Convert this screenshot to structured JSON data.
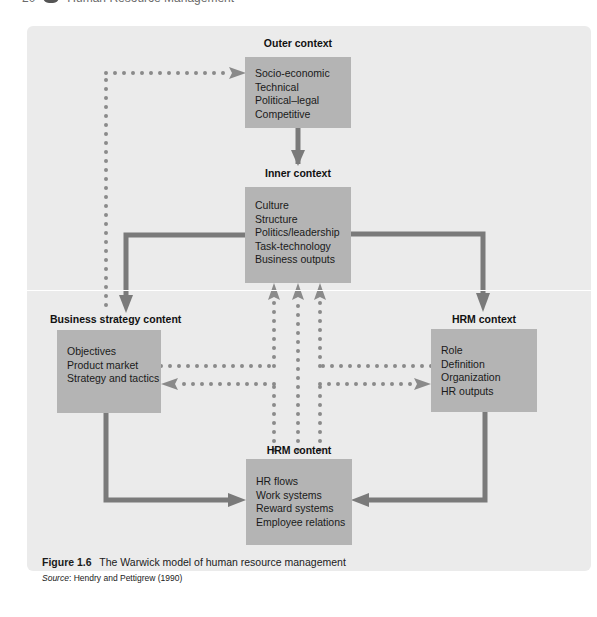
{
  "page_header": {
    "page_number": "20",
    "running_title": "Human Resource Management",
    "icon": "book-icon"
  },
  "diagram": {
    "title": "The Warwick model of human resource management",
    "colors": {
      "panel_background": "#ebebeb",
      "box_fill": "#b4b4b4",
      "arrow": "#7a7a7a",
      "dotted_arrow": "#8a8a8a"
    },
    "nodes": {
      "outer_context": {
        "title": "Outer context",
        "items": [
          "Socio-economic",
          "Technical",
          "Political–legal",
          "Competitive"
        ]
      },
      "inner_context": {
        "title": "Inner context",
        "items": [
          "Culture",
          "Structure",
          "Politics/leadership",
          "Task-technology",
          "Business outputs"
        ]
      },
      "business_strategy_content": {
        "title": "Business strategy content",
        "items": [
          "Objectives",
          "Product market",
          "Strategy and tactics"
        ]
      },
      "hrm_context": {
        "title": "HRM context",
        "items": [
          "Role",
          "Definition",
          "Organization",
          "HR outputs"
        ]
      },
      "hrm_content": {
        "title": "HRM content",
        "items": [
          "HR flows",
          "Work systems",
          "Reward systems",
          "Employee relations"
        ]
      }
    },
    "edges": [
      {
        "from": "Outer context",
        "to": "Inner context",
        "style": "solid"
      },
      {
        "from": "Inner context",
        "to": "Business strategy content",
        "style": "solid"
      },
      {
        "from": "Inner context",
        "to": "HRM context",
        "style": "solid"
      },
      {
        "from": "Business strategy content",
        "to": "HRM content",
        "style": "solid"
      },
      {
        "from": "HRM context",
        "to": "HRM content",
        "style": "solid"
      },
      {
        "from": "Business strategy content",
        "to": "Outer context",
        "style": "dotted"
      },
      {
        "from": "Business strategy content",
        "to": "Inner context",
        "style": "dotted"
      },
      {
        "from": "HRM content",
        "to": "Inner context",
        "style": "dotted"
      },
      {
        "from": "HRM context",
        "to": "Inner context",
        "style": "dotted"
      },
      {
        "from": "HRM content",
        "to": "Business strategy content",
        "style": "dotted"
      },
      {
        "from": "HRM content",
        "to": "HRM context",
        "style": "dotted"
      }
    ]
  },
  "caption": {
    "label": "Figure 1.6",
    "text": "The Warwick model of human resource management"
  },
  "source": {
    "label": "Source",
    "text": ": Hendry and Pettigrew (1990)"
  }
}
